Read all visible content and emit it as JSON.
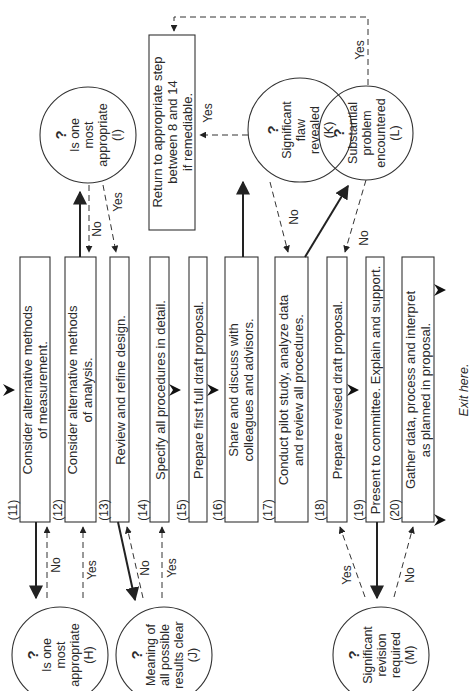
{
  "steps": [
    {
      "num": "(11)",
      "text": "Consider alternative methods|of measurement."
    },
    {
      "num": "(12)",
      "text": "Consider alternative methods|of analysis."
    },
    {
      "num": "(13)",
      "text": "Review and refine design."
    },
    {
      "num": "(14)",
      "text": "Specify all procedures in detail."
    },
    {
      "num": "(15)",
      "text": "Prepare first full draft proposal."
    },
    {
      "num": "(16)",
      "text": "Share and discuss with|colleagues and advisors."
    },
    {
      "num": "(17)",
      "text": "Conduct pilot study, analyze data|and review all procedures."
    },
    {
      "num": "(18)",
      "text": "Prepare revised draft proposal."
    },
    {
      "num": "(19)",
      "text": "Present to committee. Explain and support."
    },
    {
      "num": "(20)",
      "text": "Gather data, process and interpret|as planned in proposal."
    }
  ],
  "decisions": {
    "H": {
      "mark": "?",
      "lines": [
        "Is one",
        "most",
        "appropriate",
        "(H)"
      ]
    },
    "I": {
      "mark": "?",
      "lines": [
        "Is one",
        "most",
        "appropriate",
        "(I)"
      ]
    },
    "J": {
      "mark": "?",
      "lines": [
        "Meaning of",
        "all possible",
        "results clear",
        "(J)"
      ]
    },
    "K": {
      "mark": "?",
      "lines": [
        "Significant",
        "flaw",
        "revealed",
        "(K)"
      ]
    },
    "L": {
      "mark": "?",
      "lines": [
        "Substantial",
        "problem",
        "encountered",
        "(L)"
      ]
    },
    "M": {
      "mark": "?",
      "lines": [
        "Significant",
        "revision",
        "required",
        "(M)"
      ]
    }
  },
  "return_box": {
    "lines": [
      "Return to appropriate step",
      "between 8 and 14",
      "if remediable."
    ]
  },
  "edge_labels": {
    "h_no": "No",
    "h_yes": "Yes",
    "j_no": "No",
    "j_yes": "Yes",
    "i_no": "No",
    "i_yes": "Yes",
    "k_yes": "Yes",
    "k_no": "No",
    "l_yes": "Yes",
    "l_no": "No",
    "m_yes": "Yes",
    "m_no": "No"
  },
  "exit_label": "Exit here."
}
